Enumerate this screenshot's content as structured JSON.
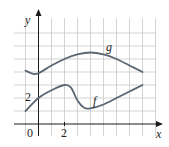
{
  "chart_data": {
    "type": "line",
    "title": "",
    "xlabel": "x",
    "ylabel": "y",
    "x_tick_labels": [
      "0",
      "2"
    ],
    "y_tick_labels": [
      "2"
    ],
    "xlim": [
      -1.8,
      8.9
    ],
    "ylim": [
      -0.9,
      7.1
    ],
    "grid": true,
    "legend": "none (curves labeled directly)",
    "series": [
      {
        "name": "g",
        "label": "g",
        "x": [
          -1,
          -0.4,
          0,
          1,
          2,
          3,
          4,
          5,
          6,
          7,
          8
        ],
        "y": [
          4.1,
          3.85,
          3.9,
          4.5,
          5.0,
          5.35,
          5.5,
          5.35,
          5.0,
          4.5,
          4.0
        ]
      },
      {
        "name": "f",
        "label": "f",
        "x": [
          -1,
          0,
          1,
          2,
          2.5,
          3,
          3.5,
          4,
          5,
          6,
          7,
          8
        ],
        "y": [
          1.0,
          2.0,
          2.6,
          3.0,
          2.8,
          1.8,
          1.25,
          1.2,
          1.5,
          2.0,
          2.5,
          3.0
        ]
      }
    ],
    "annotations": [
      {
        "text": "g",
        "near": [
          5.5,
          5.8
        ]
      },
      {
        "text": "f",
        "near": [
          4.4,
          1.8
        ]
      }
    ]
  },
  "labels": {
    "x_axis": "x",
    "y_axis": "y",
    "origin": "0",
    "x_tick": "2",
    "y_tick": "2",
    "curve_g": "g",
    "curve_f": "f"
  },
  "colors": {
    "curve": "#5b6673",
    "grid": "#c8c8c8",
    "axis": "#1a1a1a"
  }
}
